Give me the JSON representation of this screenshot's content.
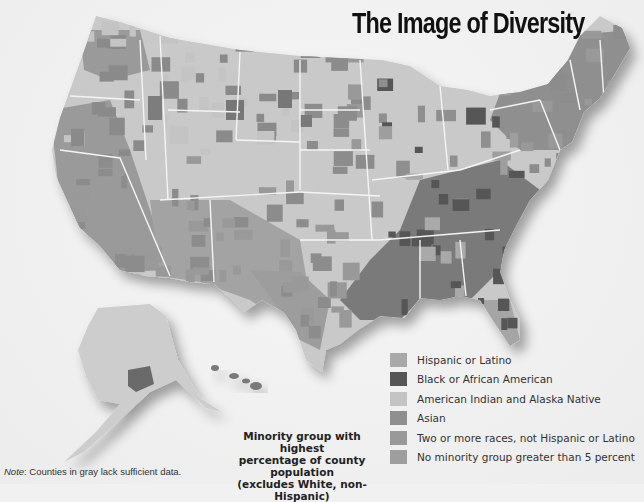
{
  "title": "The Image of Diversity",
  "legend": {
    "caption_lines": [
      "Minority group with highest",
      "percentage of county population",
      "(excludes White, non-Hispanic)"
    ],
    "items": [
      {
        "label": "Hispanic or Latino",
        "color": "#a9a9a9"
      },
      {
        "label": "Black or African American",
        "color": "#565656"
      },
      {
        "label": "American Indian and Alaska Native",
        "color": "#c4c4c4"
      },
      {
        "label": "Asian",
        "color": "#8f8f8f"
      },
      {
        "label": "Two or more races, not Hispanic or Latino",
        "color": "#999999"
      },
      {
        "label": "No minority group greater than 5 percent",
        "color": "#9e9e9e"
      }
    ]
  },
  "note": {
    "prefix": "Note",
    "text": ": Counties in gray lack sufficient data."
  },
  "map": {
    "land_color": "#c9c9c9",
    "border_color": "#f4f4f4",
    "regions": [
      "Contiguous United States",
      "Alaska",
      "Hawaii"
    ]
  }
}
